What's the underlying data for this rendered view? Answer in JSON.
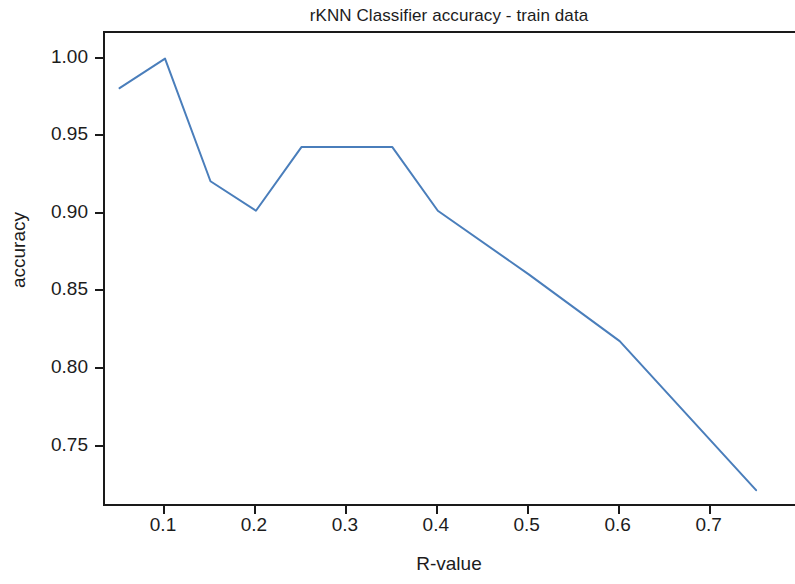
{
  "chart_data": {
    "type": "line",
    "title": "rKNN Classifier accuracy - train data",
    "xlabel": "R-value",
    "ylabel": "accuracy",
    "grid": false,
    "legend": null,
    "xlim": [
      0.034,
      0.795
    ],
    "ylim": [
      0.7105,
      1.0165
    ],
    "xticks": [
      0.1,
      0.2,
      0.3,
      0.4,
      0.5,
      0.6,
      0.7
    ],
    "xtick_labels": [
      "0.1",
      "0.2",
      "0.3",
      "0.4",
      "0.5",
      "0.6",
      "0.7"
    ],
    "yticks": [
      1.0,
      0.95,
      0.9,
      0.85,
      0.8,
      0.75
    ],
    "ytick_labels": [
      "1.00",
      "0.95",
      "0.90",
      "0.85",
      "0.80",
      "0.75"
    ],
    "line_color": "#4a7ebb",
    "line_width": 2,
    "series": [
      {
        "name": "train accuracy",
        "x": [
          0.05,
          0.1,
          0.15,
          0.2,
          0.25,
          0.3,
          0.35,
          0.4,
          0.5,
          0.6,
          0.75
        ],
        "y": [
          0.981,
          1.0,
          0.921,
          0.902,
          0.943,
          0.943,
          0.943,
          0.902,
          0.861,
          0.818,
          0.722
        ]
      }
    ]
  }
}
